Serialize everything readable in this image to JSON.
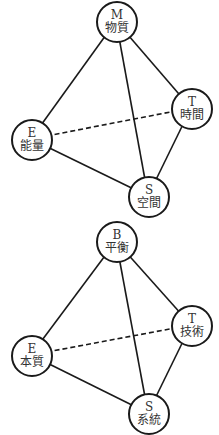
{
  "diagrams": [
    {
      "id": "top",
      "nodes": {
        "top": {
          "letter": "M",
          "label": "物質",
          "cx": 116,
          "cy": 21
        },
        "right": {
          "letter": "T",
          "label": "時間",
          "cx": 191,
          "cy": 108
        },
        "left": {
          "letter": "E",
          "label": "能量",
          "cx": 31,
          "cy": 139
        },
        "bottom": {
          "letter": "S",
          "label": "空間",
          "cx": 148,
          "cy": 196
        }
      },
      "edges": [
        {
          "from": "top",
          "to": "left",
          "style": "solid"
        },
        {
          "from": "top",
          "to": "right",
          "style": "solid"
        },
        {
          "from": "top",
          "to": "bottom",
          "style": "solid"
        },
        {
          "from": "left",
          "to": "bottom",
          "style": "solid"
        },
        {
          "from": "right",
          "to": "bottom",
          "style": "solid"
        },
        {
          "from": "left",
          "to": "right",
          "style": "dashed"
        }
      ]
    },
    {
      "id": "bottom",
      "nodes": {
        "top": {
          "letter": "B",
          "label": "平衡",
          "cx": 116,
          "cy": 24
        },
        "right": {
          "letter": "T",
          "label": "技術",
          "cx": 191,
          "cy": 108
        },
        "left": {
          "letter": "E",
          "label": "本質",
          "cx": 31,
          "cy": 138
        },
        "bottom": {
          "letter": "S",
          "label": "系統",
          "cx": 148,
          "cy": 196
        }
      },
      "edges": [
        {
          "from": "top",
          "to": "left",
          "style": "solid"
        },
        {
          "from": "top",
          "to": "right",
          "style": "solid"
        },
        {
          "from": "top",
          "to": "bottom",
          "style": "solid"
        },
        {
          "from": "left",
          "to": "bottom",
          "style": "solid"
        },
        {
          "from": "right",
          "to": "bottom",
          "style": "solid"
        },
        {
          "from": "left",
          "to": "right",
          "style": "dashed"
        }
      ]
    }
  ],
  "colors": {
    "line": "#1a1a1a",
    "text": "#333333",
    "background": "#ffffff"
  }
}
